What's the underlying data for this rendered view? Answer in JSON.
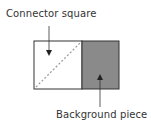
{
  "labels": {
    "connector": "Connector square",
    "background": "Background piece"
  },
  "colors": {
    "outline": "#333333",
    "connector_fill": "#ffffff",
    "background_fill": "#8a8a8a",
    "diagonal": "#999999"
  }
}
